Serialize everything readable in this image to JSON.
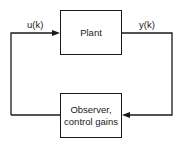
{
  "diagram": {
    "type": "feedback-loop block diagram",
    "blocks": {
      "plant": {
        "label": "Plant"
      },
      "observer": {
        "line1": "Observer,",
        "line2": "control gains"
      }
    },
    "signals": {
      "input": "u(k)",
      "output": "y(k)"
    },
    "colors": {
      "line": "#1a1a1a",
      "background": "#ffffff"
    }
  }
}
